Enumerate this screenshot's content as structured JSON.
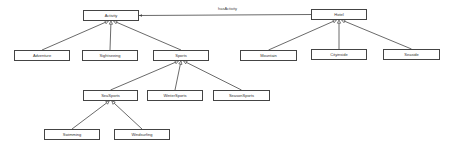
{
  "diagram": {
    "type": "uml-class-diagram",
    "nodes": [
      {
        "id": "activity",
        "label": "Activity",
        "x": 83,
        "y": 10,
        "w": 56,
        "h": 11
      },
      {
        "id": "adventure",
        "label": "Adventure",
        "x": 14,
        "y": 50,
        "w": 56,
        "h": 11
      },
      {
        "id": "sightseeing",
        "label": "Sightseeing",
        "x": 82,
        "y": 50,
        "w": 56,
        "h": 11
      },
      {
        "id": "sports",
        "label": "Sports",
        "x": 153,
        "y": 50,
        "w": 56,
        "h": 11
      },
      {
        "id": "hotel",
        "label": "Hotel",
        "x": 311,
        "y": 9,
        "w": 56,
        "h": 11
      },
      {
        "id": "mountain",
        "label": "Mountain",
        "x": 240,
        "y": 50,
        "w": 57,
        "h": 11
      },
      {
        "id": "cityinside",
        "label": "Cityinside",
        "x": 311,
        "y": 49,
        "w": 56,
        "h": 11
      },
      {
        "id": "seaside",
        "label": "Seaside",
        "x": 383,
        "y": 49,
        "w": 57,
        "h": 11
      },
      {
        "id": "seasports",
        "label": "SeaSports",
        "x": 83,
        "y": 90,
        "w": 55,
        "h": 11
      },
      {
        "id": "wintersports",
        "label": "WinterSports",
        "x": 147,
        "y": 90,
        "w": 56,
        "h": 11
      },
      {
        "id": "seasonsports",
        "label": "SeasonSports",
        "x": 213,
        "y": 90,
        "w": 57,
        "h": 11
      },
      {
        "id": "swimming",
        "label": "Swimming",
        "x": 44,
        "y": 129,
        "w": 56,
        "h": 11
      },
      {
        "id": "windsurfing",
        "label": "Windsurfing",
        "x": 114,
        "y": 129,
        "w": 56,
        "h": 11
      }
    ],
    "edges": [
      {
        "type": "association",
        "from": "hotel",
        "to": "activity",
        "label": "hasActivity"
      },
      {
        "type": "generalization",
        "from": "adventure",
        "to": "activity"
      },
      {
        "type": "generalization",
        "from": "sightseeing",
        "to": "activity"
      },
      {
        "type": "generalization",
        "from": "sports",
        "to": "activity"
      },
      {
        "type": "generalization",
        "from": "mountain",
        "to": "hotel"
      },
      {
        "type": "generalization",
        "from": "cityinside",
        "to": "hotel"
      },
      {
        "type": "generalization",
        "from": "seaside",
        "to": "hotel"
      },
      {
        "type": "generalization",
        "from": "seasports",
        "to": "sports"
      },
      {
        "type": "generalization",
        "from": "wintersports",
        "to": "sports"
      },
      {
        "type": "generalization",
        "from": "seasonsports",
        "to": "sports"
      },
      {
        "type": "generalization",
        "from": "swimming",
        "to": "seasports"
      },
      {
        "type": "generalization",
        "from": "windsurfing",
        "to": "seasports"
      }
    ],
    "edge_label": {
      "text": "hasActivity",
      "x": 218,
      "y": 6
    },
    "colors": {
      "stroke": "#444444",
      "fill": "#ffffff",
      "text": "#333333"
    }
  }
}
